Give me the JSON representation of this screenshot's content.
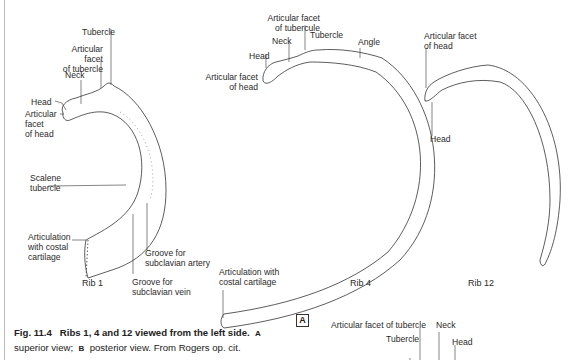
{
  "figure": {
    "number": "Fig. 11.4",
    "title": "Ribs 1, 4 and 12 viewed from the left side.",
    "view_a_letter": "A",
    "view_a_text": "superior view;",
    "view_b_letter": "B",
    "view_b_text": "posterior view. From Rogers op. cit.",
    "panel_label": "A"
  },
  "rib1": {
    "name": "Rib 1",
    "labels": {
      "tubercle": "Tubercle",
      "articular_facet_tubercle": "Articular facet\nof tubercle",
      "neck": "Neck",
      "head": "Head",
      "articular_facet_head": "Articular\nfacet\nof head",
      "scalene_tubercle": "Scalene\ntubercle",
      "articulation_costal": "Articulation\nwith costal\ncartilage",
      "groove_artery": "Groove for\nsubclavian artery",
      "groove_vein": "Groove for\nsubclavian vein"
    }
  },
  "rib4": {
    "name": "Rib 4",
    "labels": {
      "articular_facet_tubercule": "Articular facet\nof tubercule",
      "neck": "Neck",
      "tubercle": "Tubercle",
      "angle": "Angle",
      "head": "Head",
      "articular_facet_head": "Articular facet\nof head",
      "articulation_costal": "Articulation with\ncostal cartilage"
    }
  },
  "rib12": {
    "name": "Rib 12",
    "labels": {
      "articular_facet_head": "Articular facet\nof head",
      "head": "Head"
    }
  },
  "panel_b_partial": {
    "labels": {
      "articular_facet_tubercle": "Articular facet of tubercle",
      "neck": "Neck",
      "tubercle": "Tubercle",
      "head": "Head"
    }
  }
}
